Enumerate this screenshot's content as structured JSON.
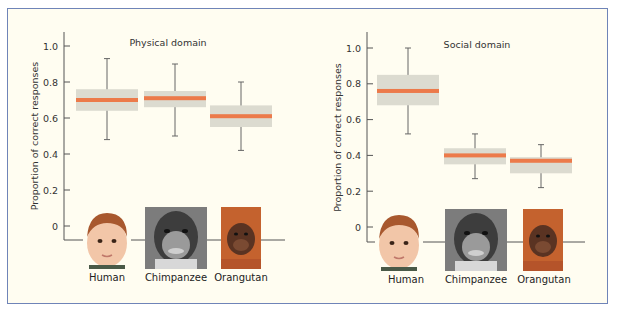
{
  "chart_data": [
    {
      "type": "box",
      "title": "Physical domain",
      "xlabel": "",
      "ylabel": "Proportion of correct responses",
      "ylim": [
        0,
        1.0
      ],
      "yticks": [
        "0",
        "0.2",
        "0.4",
        "0.6",
        "0.8",
        "1.0"
      ],
      "grid": false,
      "categories": [
        "Human",
        "Chimpanzee",
        "Orangutan"
      ],
      "median": [
        0.7,
        0.71,
        0.61
      ],
      "q1": [
        0.64,
        0.66,
        0.55
      ],
      "q3": [
        0.76,
        0.75,
        0.67
      ],
      "whisker_low": [
        0.48,
        0.5,
        0.42
      ],
      "whisker_high": [
        0.93,
        0.9,
        0.8
      ]
    },
    {
      "type": "box",
      "title": "Social domain",
      "xlabel": "",
      "ylabel": "Proportion of correct responses",
      "ylim": [
        0,
        1.0
      ],
      "yticks": [
        "0",
        "0.2",
        "0.4",
        "0.6",
        "0.8",
        "1.0"
      ],
      "grid": false,
      "categories": [
        "Human",
        "Chimpanzee",
        "Orangutan"
      ],
      "median": [
        0.76,
        0.4,
        0.37
      ],
      "q1": [
        0.68,
        0.35,
        0.3
      ],
      "q3": [
        0.85,
        0.44,
        0.39
      ],
      "whisker_low": [
        0.52,
        0.27,
        0.22
      ],
      "whisker_high": [
        1.0,
        0.52,
        0.46
      ]
    }
  ],
  "colors": {
    "box_fill": "#dcdbd0",
    "median": "#ec7a4a",
    "axis": "#555555",
    "frame_border": "#6f84b8",
    "background": "#fffdf1"
  },
  "panels": [
    {
      "title": "Physical domain",
      "ylabel": "Proportion of correct responses",
      "labels": [
        "Human",
        "Chimpanzee",
        "Orangutan"
      ]
    },
    {
      "title": "Social domain",
      "ylabel": "Proportion of correct responses",
      "labels": [
        "Human",
        "Chimpanzee",
        "Orangutan"
      ]
    }
  ],
  "images": [
    "human-child-photo",
    "chimpanzee-photo",
    "orangutan-photo"
  ]
}
